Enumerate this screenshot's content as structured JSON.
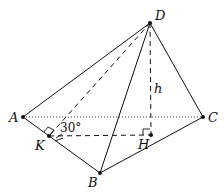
{
  "diagram": {
    "type": "pyramid-geometry",
    "points": {
      "A": {
        "label": "A",
        "x": 23,
        "y": 117
      },
      "B": {
        "label": "B",
        "x": 100,
        "y": 173
      },
      "C": {
        "label": "C",
        "x": 203,
        "y": 117
      },
      "D": {
        "label": "D",
        "x": 150,
        "y": 23
      },
      "K": {
        "label": "K",
        "x": 49,
        "y": 136
      },
      "H": {
        "label": "H",
        "x": 151,
        "y": 135
      }
    },
    "height_label": "h",
    "angle_label": "30°",
    "colors": {
      "stroke": "#111111"
    }
  }
}
